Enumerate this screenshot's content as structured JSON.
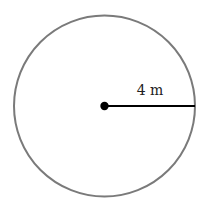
{
  "diagram": {
    "type": "circle-radius",
    "circle": {
      "cx": 104.5,
      "cy": 106,
      "r": 90.5,
      "stroke": "#7a7a7a",
      "stroke_width": 2
    },
    "center_dot": {
      "r": 4.2,
      "fill": "#000000"
    },
    "radius_line": {
      "x2": 195,
      "stroke": "#000000",
      "stroke_width": 2.2
    },
    "radius_label": "4 m",
    "label_position": {
      "x": 150,
      "y": 95
    }
  }
}
